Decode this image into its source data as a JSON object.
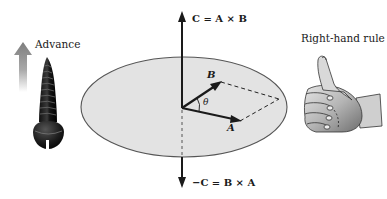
{
  "diagram": {
    "type": "cross-product illustration",
    "labels": {
      "advance": "Advance",
      "right_hand_rule": "Right-hand rule",
      "c_equation": "C = A × B",
      "neg_c_equation": "−C = B × A",
      "vector_a": "A",
      "vector_b": "B",
      "angle": "θ"
    },
    "icons": {
      "advance_arrow": "up-arrow-gradient",
      "screw": "screw-illustration",
      "hand": "thumbs-up-hand-illustration"
    },
    "colors": {
      "ellipse_fill": "#e3e3e3",
      "ellipse_stroke": "#555555",
      "vector": "#1a1a1a",
      "advance_arrow": "#8c8c8c",
      "screw": "#1e1e1e",
      "hand_skin": "#bdbdbd"
    },
    "geometry": {
      "origin": [
        182,
        108
      ],
      "vector_a_tip": [
        240,
        121
      ],
      "vector_b_tip": [
        221,
        82
      ],
      "parallelogram_far_corner": [
        279,
        99
      ],
      "axis_top": [
        182,
        12
      ],
      "axis_bottom": [
        182,
        187
      ],
      "ellipse_center": [
        184,
        107
      ],
      "ellipse_radii": [
        103,
        50
      ]
    }
  }
}
